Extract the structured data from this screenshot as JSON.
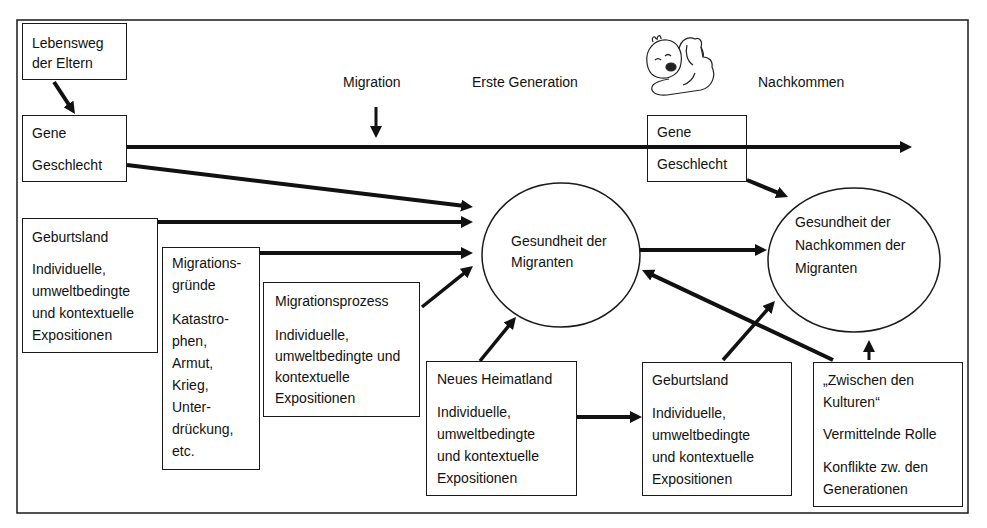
{
  "header": {
    "migration_label": "Migration",
    "first_generation_label": "Erste Generation",
    "descendants_label": "Nachkommen",
    "illustration": "baby-icon"
  },
  "boxes": {
    "parents_life_course": {
      "lines": [
        "Lebensweg",
        "der Eltern"
      ]
    },
    "genes_sex_first_generation": {
      "items": [
        "Gene",
        "Geschlecht"
      ]
    },
    "country_of_birth": {
      "title": "Geburtsland",
      "lines": [
        "Individuelle,",
        "umweltbedingte",
        "und kontextuelle",
        "Expositionen"
      ]
    },
    "migration_reasons": {
      "title_lines": [
        "Migrations-",
        "gründe"
      ],
      "lines": [
        "Katastro-",
        "phen,",
        "Armut,",
        "Krieg,",
        "Unter-",
        "drückung,",
        "etc."
      ]
    },
    "migration_process": {
      "title": "Migrationsprozess",
      "lines": [
        "Individuelle,",
        "umweltbedingte und",
        "kontextuelle",
        "Expositionen"
      ]
    },
    "new_homeland": {
      "title": "Neues Heimatland",
      "lines": [
        "Individuelle,",
        "umweltbedingte",
        "und kontextuelle",
        "Expositionen"
      ]
    },
    "descendants_country_of_birth": {
      "title": "Geburtsland",
      "lines": [
        "Individuelle,",
        "umweltbedingte",
        "und kontextuelle",
        "Expositionen"
      ]
    },
    "between_cultures": {
      "title_lines": [
        "„Zwischen den",
        "Kulturen“"
      ],
      "role": "Vermittelnde Rolle",
      "conflict_lines": [
        "Konflikte zw. den",
        "Generationen"
      ]
    },
    "genes_sex_descendants": {
      "items": [
        "Gene",
        "Geschlecht"
      ]
    }
  },
  "ellipses": {
    "migrant_health": {
      "lines": [
        "Gesundheit der",
        "Migranten"
      ]
    },
    "descendant_health": {
      "lines": [
        "Gesundheit der",
        "Nachkommen der",
        "Migranten"
      ]
    }
  },
  "connections": [
    {
      "from": "Lebensweg der Eltern",
      "to": "Gene / Geschlecht (Erste Generation)"
    },
    {
      "from": "Gene (Erste Generation)",
      "to": "Gene (Nachkommen)"
    },
    {
      "from": "Geschlecht (Erste Generation)",
      "to": "Gesundheit der Migranten"
    },
    {
      "from": "Geburtsland",
      "to": "Gesundheit der Migranten"
    },
    {
      "from": "Migrationsgründe",
      "to": "Gesundheit der Migranten"
    },
    {
      "from": "Migrationsprozess",
      "to": "Gesundheit der Migranten"
    },
    {
      "from": "Migration",
      "to": "Zeitachse"
    },
    {
      "from": "Neues Heimatland",
      "to": "Gesundheit der Migranten"
    },
    {
      "from": "Neues Heimatland",
      "to": "Geburtsland (Nachkommen)"
    },
    {
      "from": "Gesundheit der Migranten",
      "to": "Gesundheit der Nachkommen der Migranten"
    },
    {
      "from": "Geschlecht (Nachkommen)",
      "to": "Gesundheit der Nachkommen der Migranten"
    },
    {
      "from": "Geburtsland (Nachkommen)",
      "to": "Gesundheit der Nachkommen der Migranten"
    },
    {
      "from": "Zwischen den Kulturen",
      "to": "Gesundheit der Migranten"
    },
    {
      "from": "Zwischen den Kulturen",
      "to": "Gesundheit der Nachkommen der Migranten"
    }
  ],
  "colors": {
    "stroke": "#111111",
    "background": "#ffffff"
  }
}
